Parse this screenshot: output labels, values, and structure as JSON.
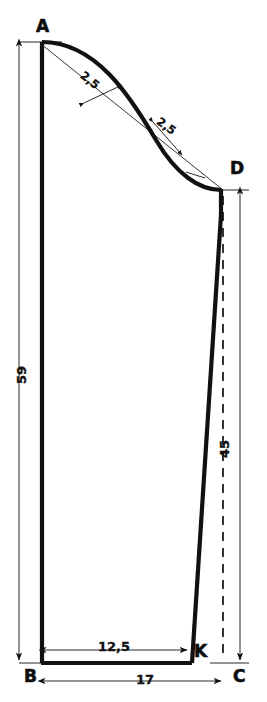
{
  "drawing": {
    "title": "Sleeve / trouser pattern construction drawing",
    "units_note": "centimetres",
    "ink_color": "#111111",
    "paper_color": "#ffffff",
    "points": [
      {
        "id": "A",
        "label": "A",
        "x": 41,
        "y": 42
      },
      {
        "id": "D",
        "label": "D",
        "x": 223,
        "y": 190
      },
      {
        "id": "B",
        "label": "B",
        "x": 41,
        "y": 663
      },
      {
        "id": "C",
        "label": "C",
        "x": 223,
        "y": 663
      },
      {
        "id": "K",
        "label": "K",
        "x": 190,
        "y": 663
      }
    ],
    "dimensions": [
      {
        "id": "height-left",
        "label": "59",
        "value": 59,
        "orientation": "vertical",
        "from": "A",
        "to": "B"
      },
      {
        "id": "height-right",
        "label": "45",
        "value": 45,
        "orientation": "vertical",
        "from": "D",
        "to": "C"
      },
      {
        "id": "width-inner",
        "label": "12,5",
        "value": 12.5,
        "orientation": "horizontal",
        "from": "B",
        "to": "K"
      },
      {
        "id": "width-total",
        "label": "17",
        "value": 17,
        "orientation": "horizontal",
        "from": "B",
        "to": "C"
      },
      {
        "id": "curve-offset-upper",
        "label": "2,5",
        "value": 2.5,
        "orientation": "perpendicular",
        "from": "chord-AD",
        "to": "curve-upper"
      },
      {
        "id": "curve-offset-lower",
        "label": "2,5",
        "value": 2.5,
        "orientation": "perpendicular",
        "from": "chord-AD",
        "to": "curve-lower"
      }
    ],
    "lines": [
      {
        "id": "edge-AB",
        "style": "solid-thick",
        "description": "left vertical edge from A down to B"
      },
      {
        "id": "edge-BK",
        "style": "solid-thick",
        "description": "bottom edge from B to K"
      },
      {
        "id": "edge-KD",
        "style": "solid-thick",
        "description": "right slanted edge from K up to D"
      },
      {
        "id": "curve-AD",
        "style": "solid-thick",
        "description": "S-shaped curve from A to D"
      },
      {
        "id": "chord-AD",
        "style": "solid-thin",
        "description": "straight construction chord from A to D"
      },
      {
        "id": "dashed-DC",
        "style": "dashed-thin",
        "description": "dashed vertical projection line from D down to C"
      },
      {
        "id": "ext-A",
        "style": "solid-thin",
        "description": "horizontal extension line at A"
      },
      {
        "id": "ext-B",
        "style": "solid-thin",
        "description": "horizontal extension line at B"
      },
      {
        "id": "ext-D",
        "style": "solid-thin",
        "description": "horizontal extension line at D"
      },
      {
        "id": "ext-C",
        "style": "solid-thin",
        "description": "horizontal extension line at C"
      }
    ]
  }
}
